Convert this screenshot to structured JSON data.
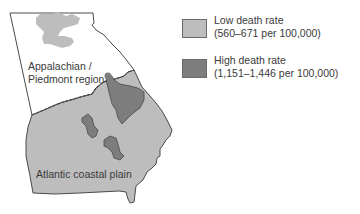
{
  "map": {
    "title": "",
    "regions": [
      {
        "name": "Appalachian / Piedmont region",
        "label_lines": [
          "Appalachian /",
          "Piedmont region"
        ]
      },
      {
        "name": "Atlantic coastal plain",
        "label_lines": [
          "Atlantic coastal plain"
        ]
      }
    ],
    "colors": {
      "low": "#bdbdbd",
      "high": "#7d7d7d",
      "outline": "#4a4a4a",
      "background": "#ffffff"
    }
  },
  "legend": {
    "items": [
      {
        "key": "low",
        "label": "Low death rate",
        "range": "(560–671 per 100,000)",
        "color": "#bdbdbd"
      },
      {
        "key": "high",
        "label": "High death rate",
        "range": "(1,151–1,446 per 100,000)",
        "color": "#7d7d7d"
      }
    ]
  }
}
